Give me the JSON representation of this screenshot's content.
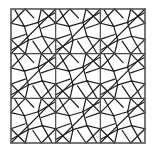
{
  "figure": {
    "name": "pinwheel-tiling-square",
    "kind": "geometric-line-drawing",
    "background_color": "#ffffff",
    "line_color": "#1a1a1a",
    "outer_border_color": "#555555",
    "outer_border_width": 1.6,
    "grid_line_width": 1.2,
    "tile_line_width": 1.2
  },
  "edge_label": {
    "text": "C",
    "visible_fragment": true
  },
  "geometry": {
    "square_left": 11,
    "square_top": 9,
    "square_size": 134,
    "grid_rows": 3,
    "grid_cols": 3,
    "cell_size": 44.667,
    "tile": {
      "type": "pinwheel",
      "diagonal": "top-right-to-bottom-left",
      "center_square_fraction": 0.2,
      "pinwheel_offset_fraction": 0.28,
      "rect_count": 4
    }
  },
  "chart_data": {
    "type": "table",
    "categories": [
      "row-1",
      "row-2",
      "row-3"
    ],
    "series": [
      {
        "name": "col-1",
        "values": [
          1,
          1,
          1
        ]
      },
      {
        "name": "col-2",
        "values": [
          1,
          1,
          1
        ]
      },
      {
        "name": "col-3",
        "values": [
          1,
          1,
          1
        ]
      }
    ],
    "xlabel": "",
    "ylabel": "",
    "legend": []
  }
}
